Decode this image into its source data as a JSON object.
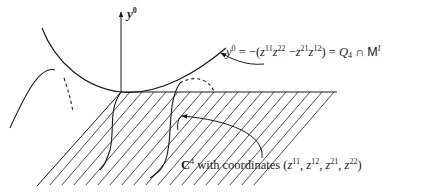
{
  "figure": {
    "axis": {
      "symbol": "y",
      "superscript": "0"
    },
    "equation": {
      "lhs_symbol": "y",
      "lhs_sup": "0",
      "eq1": " = −(",
      "t1": "z",
      "t1_sup": "11",
      "t2": "z",
      "t2_sup": "22",
      "minus": " −",
      "t3": "z",
      "t3_sup": "21",
      "t4": "z",
      "t4_sup": "12",
      "close": ") = ",
      "Q": "Q",
      "Q_sub": "4",
      "cap": " ∩ ",
      "M": "M",
      "M_sup": "I"
    },
    "plane_label": {
      "C": "C",
      "C_sup": "4",
      "text": " with coordinates (",
      "c1": "z",
      "c1_sup": "11",
      "sep1": ", ",
      "c2": "z",
      "c2_sup": "12",
      "sep2": ", ",
      "c3": "z",
      "c3_sup": "21",
      "sep3": ", ",
      "c4": "z",
      "c4_sup": "22",
      "close": ")"
    },
    "colors": {
      "ink": "#1a1a1a",
      "hatch": "#3a3a3a"
    }
  }
}
